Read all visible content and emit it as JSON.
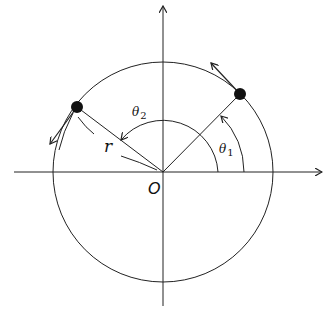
{
  "diagram": {
    "type": "circular-motion-polar-coordinates",
    "labels": {
      "origin": "O",
      "radius": "r",
      "theta1": "θ",
      "theta1_sub": "1",
      "theta2": "θ",
      "theta2_sub": "2"
    },
    "colors": {
      "line": "#222222",
      "point": "#111111",
      "background": "#ffffff"
    },
    "points": [
      {
        "name": "particle-1",
        "angle_deg": 40
      },
      {
        "name": "particle-2",
        "angle_deg": 148
      }
    ]
  }
}
